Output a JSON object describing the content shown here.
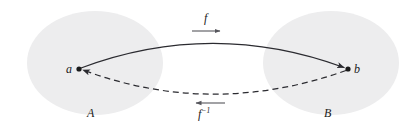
{
  "figure": {
    "background_color": "#ffffff"
  },
  "sets": [
    {
      "id": "A",
      "label": "A",
      "role": "domain",
      "icon": "ellipse-icon",
      "cx": 95,
      "cy": 63,
      "rx": 68,
      "ry": 52,
      "fill": "#ededee",
      "stroke": "none"
    },
    {
      "id": "B",
      "label": "B",
      "role": "codomain",
      "icon": "ellipse-icon",
      "cx": 331,
      "cy": 63,
      "rx": 68,
      "ry": 52,
      "fill": "#ededee",
      "stroke": "none"
    }
  ],
  "points": [
    {
      "id": "a",
      "label": "a",
      "x": 79,
      "y": 69,
      "radius": 2.6,
      "color": "#1a1a1a",
      "in_set": "A"
    },
    {
      "id": "b",
      "label": "b",
      "x": 348,
      "y": 69,
      "radius": 2.6,
      "color": "#1a1a1a",
      "in_set": "B"
    }
  ],
  "arrows": [
    {
      "id": "forward",
      "label": "f",
      "label_html": "f",
      "style": "solid",
      "direction": "a-to-b",
      "from": "a",
      "to": "b",
      "color": "#2b2b30",
      "path": "M 81 68 Q 212 19 346 68",
      "peak_y": 40
    },
    {
      "id": "inverse",
      "label": "f-1",
      "label_html": "f<sup>−1</sup>",
      "style": "dashed",
      "direction": "b-to-a",
      "from": "b",
      "to": "a",
      "color": "#2b2b30",
      "dash_pattern": "6 4",
      "path": "M 346 70 Q 212 118 81 70",
      "dip_y": 97
    }
  ],
  "annotations": {
    "forward_marker": {
      "name": "forward-direction-arrow",
      "x1": 192,
      "x2": 223,
      "y": 31,
      "direction": "right",
      "color": "#56565c"
    },
    "inverse_marker": {
      "name": "inverse-direction-arrow",
      "x1": 225,
      "x2": 193,
      "y": 103,
      "direction": "left",
      "color": "#56565c"
    }
  },
  "labels": {
    "set_a": "A",
    "set_b": "B",
    "point_a": "a",
    "point_b": "b",
    "function_f": "f",
    "function_f_inverse_base": "f",
    "function_f_inverse_exponent": "−1"
  },
  "colors": {
    "background": "#ffffff",
    "ellipse_fill": "#ededee",
    "curve": "#2b2b30",
    "marker": "#56565c",
    "text": "#1a1a1a"
  }
}
